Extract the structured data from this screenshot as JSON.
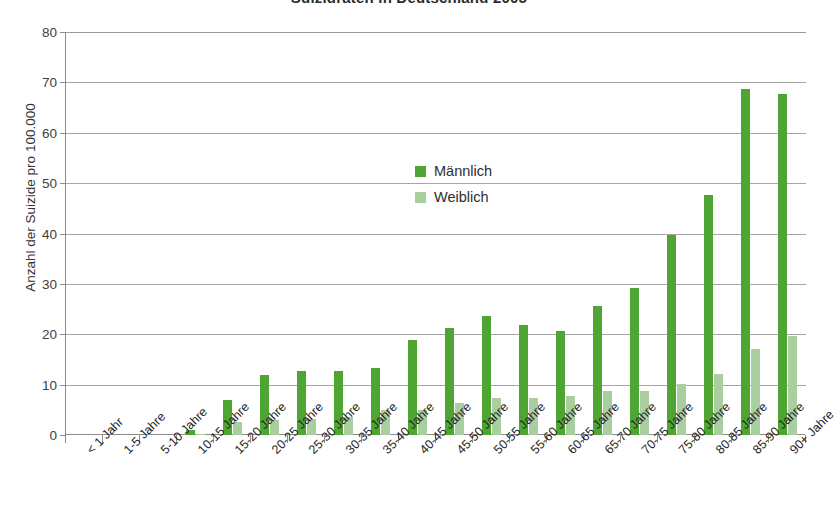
{
  "chart_data": {
    "type": "bar",
    "title": "Suizidraten in Deutschland 2005",
    "xlabel": "",
    "ylabel": "Anzahl der Suizide pro 100.000",
    "ylim": [
      0,
      80
    ],
    "yticks": [
      0,
      10,
      20,
      30,
      40,
      50,
      60,
      70,
      80
    ],
    "grid": true,
    "legend_position": "center",
    "categories": [
      "< 1 Jahr",
      "1-5 Jahre",
      "5-10 Jahre",
      "10-15 Jahre",
      "15-20 Jahre",
      "20-25 Jahre",
      "25-30 Jahre",
      "30-35 Jahre",
      "35-40 Jahre",
      "40-45 Jahre",
      "45-50 Jahre",
      "50-55 Jahre",
      "55-60 Jahre",
      "60-65 Jahre",
      "65-70 Jahre",
      "70-75 Jahre",
      "75-80 Jahre",
      "80-85 Jahre",
      "85-90 Jahre",
      "90+ Jahre"
    ],
    "series": [
      {
        "name": "Männlich",
        "color": "#4ea531",
        "values": [
          0,
          0,
          0,
          1.0,
          7.0,
          11.9,
          12.8,
          12.8,
          13.3,
          18.9,
          21.3,
          23.7,
          21.9,
          20.6,
          25.6,
          29.2,
          39.7,
          47.6,
          68.7,
          67.6
        ]
      },
      {
        "name": "Weiblich",
        "color": "#a9cfa0",
        "values": [
          0,
          0,
          0,
          0.2,
          2.5,
          3.0,
          3.1,
          3.5,
          5.0,
          5.0,
          6.4,
          7.4,
          7.3,
          7.8,
          8.8,
          8.8,
          10.1,
          12.2,
          17.0,
          19.6
        ]
      }
    ]
  },
  "legend": {
    "items": [
      {
        "label": "Männlich",
        "color": "#4ea531"
      },
      {
        "label": "Weiblich",
        "color": "#a9cfa0"
      }
    ]
  }
}
